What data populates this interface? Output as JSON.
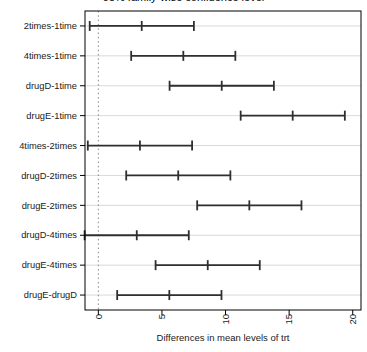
{
  "figure": {
    "note": "R-style TukeyHSD confidence-interval plot; main title clipped at top edge"
  },
  "chart_data": {
    "type": "scatter",
    "variant": "horizontal-confidence-intervals-tukey-hsd",
    "title": "95% family-wise confidence level",
    "xlabel": "Differences in mean levels of trt",
    "ylabel": "",
    "categories": [
      "2times-1time",
      "4times-1time",
      "drugD-1time",
      "drugE-1time",
      "4times-2times",
      "drugD-2times",
      "drugE-2times",
      "drugD-4times",
      "drugE-4times",
      "drugE-drugD"
    ],
    "series": [
      {
        "name": "difference",
        "values": [
          3.41,
          6.68,
          9.7,
          15.28,
          3.27,
          6.28,
          11.87,
          3.02,
          8.6,
          5.58
        ]
      },
      {
        "name": "lower",
        "values": [
          -0.68,
          2.58,
          5.6,
          11.19,
          -0.83,
          2.19,
          7.77,
          -1.08,
          4.5,
          1.48
        ]
      },
      {
        "name": "upper",
        "values": [
          7.51,
          10.77,
          13.8,
          19.38,
          7.37,
          10.38,
          15.97,
          7.11,
          12.69,
          9.68
        ]
      }
    ],
    "xticks": [
      0,
      5,
      10,
      15,
      20
    ],
    "xlim": [
      -1.05,
      20.65
    ],
    "reference_line_x": 0,
    "grid": true,
    "legend": "none",
    "xtick_label_rotation_deg": -90,
    "colors": {
      "interval": "#2f2f2f",
      "grid": "#d9d9d9",
      "reference": "#8a8a8a",
      "axis": "#000000",
      "text": "#1a1a1a",
      "background": "#ffffff"
    }
  }
}
